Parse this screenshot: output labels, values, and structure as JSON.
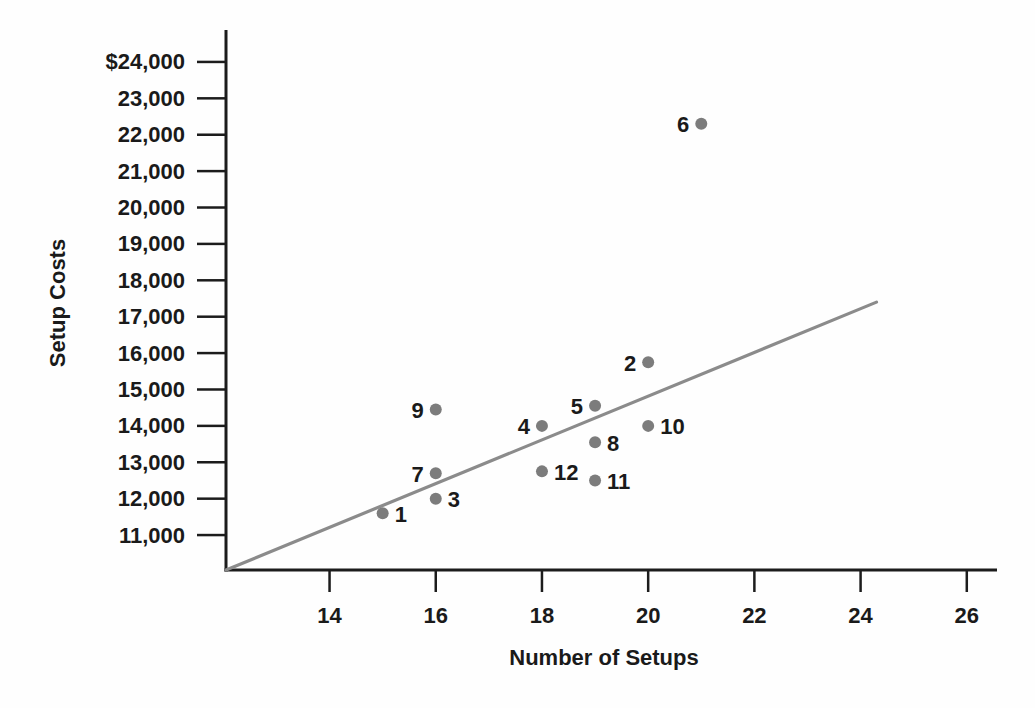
{
  "figure": {
    "background": "#fefefe"
  },
  "chart_data": {
    "type": "scatter",
    "title": "",
    "xlabel": "Number of Setups",
    "ylabel": "Setup Costs",
    "x_ticks": {
      "values": [
        14,
        16,
        18,
        20,
        22,
        24,
        26
      ],
      "labels": [
        "14",
        "16",
        "18",
        "20",
        "22",
        "24",
        "26"
      ]
    },
    "y_ticks": {
      "values": [
        11000,
        12000,
        13000,
        14000,
        15000,
        16000,
        17000,
        18000,
        19000,
        20000,
        21000,
        22000,
        23000,
        24000
      ],
      "labels": [
        "11,000",
        "12,000",
        "13,000",
        "14,000",
        "15,000",
        "16,000",
        "17,000",
        "18,000",
        "19,000",
        "20,000",
        "21,000",
        "22,000",
        "23,000",
        "$24,000"
      ]
    },
    "xlim": [
      12.05,
      26.55
    ],
    "ylim": [
      10040,
      24850
    ],
    "grid": false,
    "legend": null,
    "points": [
      {
        "id": "1",
        "x": 15,
        "y": 11600,
        "label_side": "right"
      },
      {
        "id": "2",
        "x": 20,
        "y": 15750,
        "label_side": "left"
      },
      {
        "id": "3",
        "x": 16,
        "y": 12000,
        "label_side": "right"
      },
      {
        "id": "4",
        "x": 18,
        "y": 14000,
        "label_side": "left"
      },
      {
        "id": "5",
        "x": 19,
        "y": 14550,
        "label_side": "left"
      },
      {
        "id": "6",
        "x": 21,
        "y": 22300,
        "label_side": "left"
      },
      {
        "id": "7",
        "x": 16,
        "y": 12700,
        "label_side": "left"
      },
      {
        "id": "8",
        "x": 19,
        "y": 13550,
        "label_side": "right"
      },
      {
        "id": "9",
        "x": 16,
        "y": 14450,
        "label_side": "left"
      },
      {
        "id": "10",
        "x": 20,
        "y": 14000,
        "label_side": "right"
      },
      {
        "id": "11",
        "x": 19,
        "y": 12500,
        "label_side": "right"
      },
      {
        "id": "12",
        "x": 18,
        "y": 12750,
        "label_side": "right"
      }
    ],
    "trend_line": {
      "x1": 12.05,
      "y1": 10040,
      "x2": 24.3,
      "y2": 17400
    },
    "colors": {
      "point": "#7c7c7c",
      "trend": "#8b8b8b",
      "axis": "#1c1c1c",
      "text": "#1a1a1a"
    }
  }
}
